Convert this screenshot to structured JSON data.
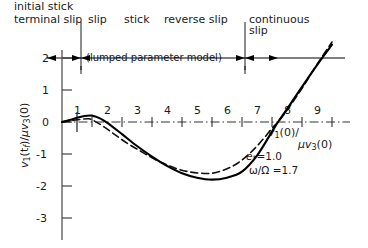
{
  "chart_data": {
    "type": "line",
    "title": "",
    "xlabel": "v1(0)/μv3(0)",
    "ylabel": "v1(tf)/μv3(0)",
    "xlim": [
      0,
      9.4
    ],
    "ylim": [
      -3.4,
      2.4
    ],
    "grid": false,
    "x_ticks": [
      "1",
      "2",
      "3",
      "4",
      "5",
      "6",
      "7",
      "8",
      "9"
    ],
    "x_tick_values": [
      1,
      2,
      3,
      4,
      5,
      6,
      7,
      8,
      9
    ],
    "y_ticks": [
      "2",
      "1",
      "0",
      "-1",
      "-2",
      "-3"
    ],
    "y_tick_values": [
      2,
      1,
      0,
      -1,
      -2,
      -3
    ],
    "legend_position": "none",
    "series": [
      {
        "name": "exact solution",
        "style": "solid",
        "points": [
          [
            0.0,
            0.0
          ],
          [
            0.25,
            0.06
          ],
          [
            0.5,
            0.13
          ],
          [
            0.75,
            0.19
          ],
          [
            1.0,
            0.2
          ],
          [
            1.25,
            0.12
          ],
          [
            1.5,
            -0.02
          ],
          [
            2.0,
            -0.38
          ],
          [
            2.5,
            -0.75
          ],
          [
            3.0,
            -1.08
          ],
          [
            3.5,
            -1.37
          ],
          [
            4.0,
            -1.6
          ],
          [
            4.5,
            -1.74
          ],
          [
            5.0,
            -1.8
          ],
          [
            5.5,
            -1.74
          ],
          [
            6.0,
            -1.55
          ],
          [
            6.5,
            -1.05
          ],
          [
            7.0,
            -0.3
          ],
          [
            7.2,
            0.0
          ],
          [
            7.5,
            0.4
          ],
          [
            8.0,
            1.1
          ],
          [
            8.5,
            1.78
          ],
          [
            9.0,
            2.42
          ]
        ]
      },
      {
        "name": "lumped parameter model",
        "style": "dashed",
        "points": [
          [
            0.0,
            0.0
          ],
          [
            0.3,
            0.04
          ],
          [
            0.6,
            0.08
          ],
          [
            0.9,
            0.1
          ],
          [
            1.1,
            0.02
          ],
          [
            1.4,
            -0.15
          ],
          [
            1.8,
            -0.42
          ],
          [
            2.2,
            -0.68
          ],
          [
            2.6,
            -0.9
          ],
          [
            3.0,
            -1.12
          ],
          [
            3.4,
            -1.3
          ],
          [
            3.8,
            -1.45
          ],
          [
            4.2,
            -1.55
          ],
          [
            4.6,
            -1.6
          ],
          [
            5.0,
            -1.6
          ],
          [
            5.4,
            -1.5
          ],
          [
            5.8,
            -1.32
          ],
          [
            6.2,
            -1.03
          ],
          [
            6.6,
            -0.65
          ],
          [
            7.0,
            -0.2
          ],
          [
            7.25,
            0.05
          ],
          [
            7.6,
            0.5
          ],
          [
            8.0,
            1.05
          ],
          [
            8.5,
            1.8
          ],
          [
            9.0,
            2.5
          ]
        ]
      }
    ],
    "annotations": [
      {
        "text": "e*=1.0",
        "x": 6.6,
        "y": -0.85
      },
      {
        "text": "ω/Ω =1.7",
        "x": 6.5,
        "y": -1.4
      }
    ]
  },
  "header": {
    "row1": {
      "line_a": "initial stick",
      "line_b": "terminal slip"
    },
    "regions": [
      "slip",
      "stick",
      "reverse slip"
    ],
    "continuous": {
      "line_a": "continuous",
      "line_b": "slip"
    },
    "bracket_label": "(lumped parameter model)"
  },
  "annotations": {
    "restitution": "e",
    "restitution_sub": "*",
    "restitution_eq": "=1.0",
    "omega_ratio": "ω/Ω =1.7"
  },
  "axis_labels": {
    "x": {
      "num_v": "v",
      "num_sub": "1",
      "num_arg": "(0)",
      "den_mu": "μv",
      "den_sub": "3",
      "den_arg": "(0)",
      "slash": "/"
    },
    "y": {
      "num_v": "v",
      "num_sub": "1",
      "num_arg": "(t",
      "num_sub2": "f",
      "num_close": ")",
      "slash": "/",
      "den_mu": "μv",
      "den_sub": "3",
      "den_arg": "(0)"
    }
  },
  "y_tick_labels": [
    "2",
    "1",
    "0",
    "-1",
    "-2",
    "-3"
  ],
  "x_tick_labels": [
    "1",
    "2",
    "3",
    "4",
    "5",
    "6",
    "7",
    "8",
    "9"
  ]
}
